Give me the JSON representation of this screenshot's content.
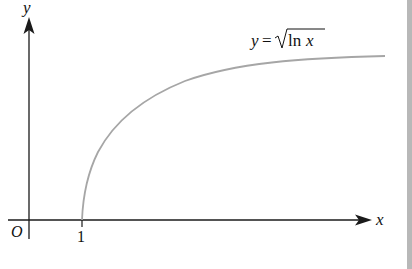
{
  "figure": {
    "type": "function-graph",
    "axes": {
      "x_label": "x",
      "y_label": "y",
      "origin_label": "O",
      "x_ticks": [
        {
          "value": 1,
          "label": "1"
        }
      ]
    },
    "curve": {
      "equation_label_y": "y",
      "equation_label_eq": "=",
      "equation_label_func": "ln",
      "equation_label_var": "x",
      "equation_text": "y = √ln x",
      "color": "#a6a6a6"
    },
    "colors": {
      "axis": "#1a1a1a",
      "curve": "#a6a6a6",
      "border": "#b8b8b8",
      "background": "#ffffff"
    }
  }
}
